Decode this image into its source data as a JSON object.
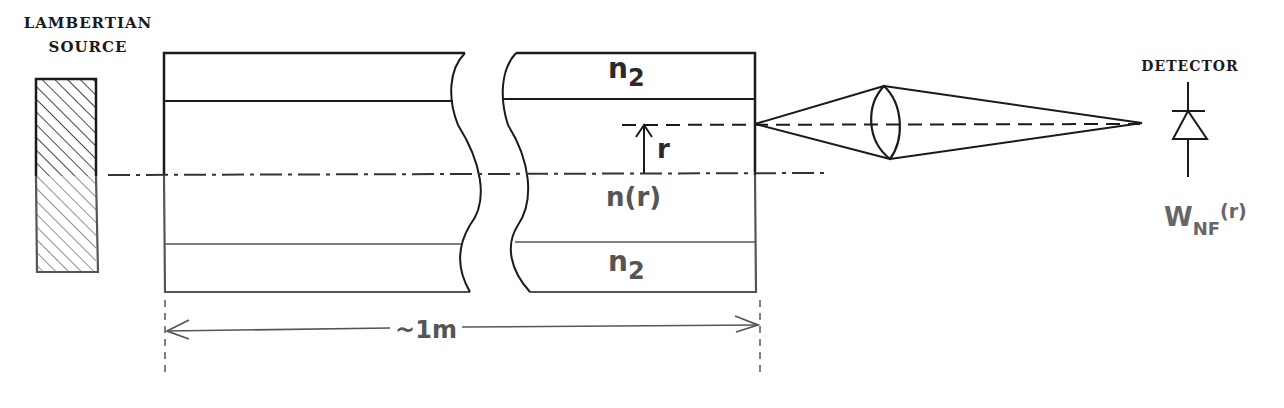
{
  "diagram": {
    "type": "optical measurement setup (refracted near-field / near-field scan of graded-index fiber)",
    "source": {
      "label_line1": "LAMBERTIAN",
      "label_line2": "SOURCE"
    },
    "fiber": {
      "cladding_top_label": "n",
      "cladding_top_sub": "2",
      "core_label": "n(r)",
      "cladding_bottom_label": "n",
      "cladding_bottom_sub": "2",
      "radial_label": "r",
      "length_label": "~1m"
    },
    "detector": {
      "label": "DETECTOR",
      "signal_main": "W",
      "signal_sub": "NF",
      "signal_arg": "(r)"
    },
    "colors": {
      "ink_dark": "#1a1a1a",
      "ink_grey": "#555555",
      "background": "#ffffff"
    }
  }
}
